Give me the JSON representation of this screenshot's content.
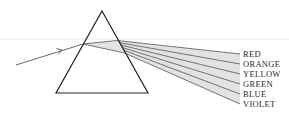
{
  "diagram": {
    "prism": {
      "apex": [
        102,
        11
      ],
      "base_left": [
        56,
        93
      ],
      "base_right": [
        148,
        93
      ],
      "stroke": "#222222"
    },
    "incoming_ray": {
      "start": [
        16,
        65
      ],
      "entry": [
        83,
        44
      ],
      "arrow_at": [
        62,
        50
      ],
      "stroke": "#555555"
    },
    "fan_fill": "#e2e2e2",
    "ray_stroke": "#555555",
    "spectrum": [
      {
        "label": "RED",
        "exit": [
          117,
          40.5
        ],
        "end": [
          240,
          54
        ]
      },
      {
        "label": "ORANGE",
        "exit": [
          118.5,
          42.5
        ],
        "end": [
          240,
          64
        ]
      },
      {
        "label": "YELLOW",
        "exit": [
          119.8,
          44.8
        ],
        "end": [
          240,
          74
        ]
      },
      {
        "label": "GREEN",
        "exit": [
          121.2,
          47.2
        ],
        "end": [
          240,
          84
        ]
      },
      {
        "label": "BLUE",
        "exit": [
          122.6,
          49.8
        ],
        "end": [
          240,
          94
        ]
      },
      {
        "label": "VIOLET",
        "exit": [
          124.5,
          53
        ],
        "end": [
          240,
          104
        ]
      }
    ],
    "labels": {
      "red": "RED",
      "orange": "ORANGE",
      "yellow": "YELLOW",
      "green": "GREEN",
      "blue": "BLUE",
      "violet": "VIOLET"
    },
    "artifact_line": {
      "y": 39,
      "color": "#ececec"
    }
  }
}
